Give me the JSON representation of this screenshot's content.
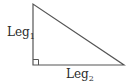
{
  "diagram": {
    "type": "right-triangle",
    "vertices": {
      "top": [
        33,
        4
      ],
      "right_angle": [
        33,
        65
      ],
      "right": [
        124,
        65
      ]
    },
    "right_angle_marker": true,
    "stroke_color": "#555555",
    "labels": {
      "leg1": {
        "base": "Leg",
        "subscript": "1"
      },
      "leg2": {
        "base": "Leg",
        "subscript": "2"
      }
    }
  }
}
